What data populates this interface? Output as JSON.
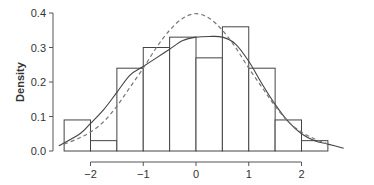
{
  "chart_data": {
    "type": "bar",
    "subtype": "histogram-with-density-curves",
    "title": "",
    "xlabel": "",
    "ylabel": "Density",
    "xlim": [
      -2.5,
      2.5
    ],
    "ylim": [
      0,
      0.4
    ],
    "x_ticks": [
      -2,
      -1,
      0,
      1,
      2
    ],
    "x_tick_labels": [
      "−2",
      "−1",
      "0",
      "1",
      "2"
    ],
    "y_ticks": [
      0.0,
      0.1,
      0.2,
      0.3,
      0.4
    ],
    "y_tick_labels": [
      "0.0",
      "0.1",
      "0.2",
      "0.3",
      "0.4"
    ],
    "grid": false,
    "legend": null,
    "bins": [
      {
        "x0": -2.5,
        "x1": -2.0,
        "density": 0.09
      },
      {
        "x0": -2.0,
        "x1": -1.5,
        "density": 0.03
      },
      {
        "x0": -1.5,
        "x1": -1.0,
        "density": 0.24
      },
      {
        "x0": -1.0,
        "x1": -0.5,
        "density": 0.3
      },
      {
        "x0": -0.5,
        "x1": 0.0,
        "density": 0.33
      },
      {
        "x0": 0.0,
        "x1": 0.5,
        "density": 0.27
      },
      {
        "x0": 0.5,
        "x1": 1.0,
        "density": 0.36
      },
      {
        "x0": 1.0,
        "x1": 1.5,
        "density": 0.24
      },
      {
        "x0": 1.5,
        "x1": 2.0,
        "density": 0.09
      },
      {
        "x0": 2.0,
        "x1": 2.5,
        "density": 0.03
      }
    ],
    "categories": [
      "-2.5 to -2",
      "-2 to -1.5",
      "-1.5 to -1",
      "-1 to -0.5",
      "-0.5 to 0",
      "0 to 0.5",
      "0.5 to 1",
      "1 to 1.5",
      "1.5 to 2",
      "2 to 2.5"
    ],
    "values": [
      0.09,
      0.03,
      0.24,
      0.3,
      0.33,
      0.27,
      0.36,
      0.24,
      0.09,
      0.03
    ],
    "series": [
      {
        "name": "kernel density estimate",
        "style": "solid",
        "x": [
          -2.6,
          -2.2,
          -2.0,
          -1.75,
          -1.5,
          -1.25,
          -1.0,
          -0.75,
          -0.5,
          -0.25,
          0.0,
          0.25,
          0.5,
          0.75,
          1.0,
          1.25,
          1.5,
          1.75,
          2.0,
          2.25,
          2.5,
          2.8
        ],
        "y": [
          0.015,
          0.05,
          0.08,
          0.12,
          0.17,
          0.22,
          0.245,
          0.27,
          0.295,
          0.32,
          0.33,
          0.332,
          0.33,
          0.31,
          0.26,
          0.195,
          0.135,
          0.085,
          0.05,
          0.03,
          0.02,
          0.008
        ]
      },
      {
        "name": "normal density",
        "style": "dashed",
        "x": [
          -2.5,
          -2.25,
          -2.0,
          -1.75,
          -1.5,
          -1.25,
          -1.0,
          -0.75,
          -0.5,
          -0.25,
          0.0,
          0.25,
          0.5,
          0.75,
          1.0,
          1.25,
          1.5,
          1.75,
          2.0,
          2.25,
          2.5
        ],
        "y": [
          0.02,
          0.035,
          0.055,
          0.085,
          0.13,
          0.185,
          0.24,
          0.3,
          0.35,
          0.385,
          0.398,
          0.385,
          0.35,
          0.3,
          0.24,
          0.185,
          0.13,
          0.085,
          0.055,
          0.035,
          0.02
        ]
      }
    ]
  }
}
